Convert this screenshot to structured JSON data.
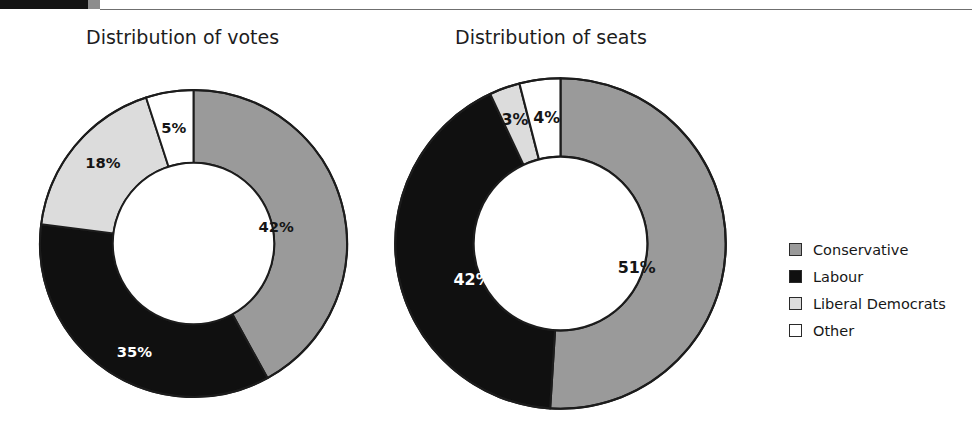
{
  "page": {
    "top_artifact_text": "g  p"
  },
  "charts": [
    {
      "id": "votes",
      "title": "Distribution of votes",
      "labels": [
        "42%",
        "35%",
        "18%",
        "5%"
      ]
    },
    {
      "id": "seats",
      "title": "Distribution of seats",
      "labels": [
        "51%",
        "42%",
        "3%",
        "4%"
      ]
    }
  ],
  "legend": {
    "items": [
      {
        "label": "Conservative",
        "color": "#9a9a9a"
      },
      {
        "label": "Labour",
        "color": "#101010"
      },
      {
        "label": "Liberal Democrats",
        "color": "#dcdcdc"
      },
      {
        "label": "Other",
        "color": "#ffffff"
      }
    ]
  },
  "colors": {
    "conservative": "#9a9a9a",
    "labour": "#101010",
    "libdem": "#dcdcdc",
    "other": "#ffffff",
    "outline": "#1c1c1c"
  },
  "chart_data": [
    {
      "type": "pie",
      "title": "Distribution of votes",
      "subtitle": "",
      "variant": "donut",
      "start_angle_deg": 0,
      "direction": "clockwise",
      "categories": [
        "Conservative",
        "Labour",
        "Liberal Democrats",
        "Other"
      ],
      "values": [
        42,
        35,
        18,
        5
      ],
      "value_labels": [
        "42%",
        "35%",
        "18%",
        "5%"
      ],
      "unit": "percent",
      "colors": [
        "#9a9a9a",
        "#101010",
        "#dcdcdc",
        "#ffffff"
      ],
      "legend_position": "right",
      "grid": false
    },
    {
      "type": "pie",
      "title": "Distribution of seats",
      "subtitle": "",
      "variant": "donut",
      "start_angle_deg": 0,
      "direction": "clockwise",
      "categories": [
        "Conservative",
        "Labour",
        "Liberal Democrats",
        "Other"
      ],
      "values": [
        51,
        42,
        3,
        4
      ],
      "value_labels": [
        "51%",
        "42%",
        "3%",
        "4%"
      ],
      "unit": "percent",
      "colors": [
        "#9a9a9a",
        "#101010",
        "#dcdcdc",
        "#ffffff"
      ],
      "legend_position": "right",
      "grid": false
    }
  ]
}
